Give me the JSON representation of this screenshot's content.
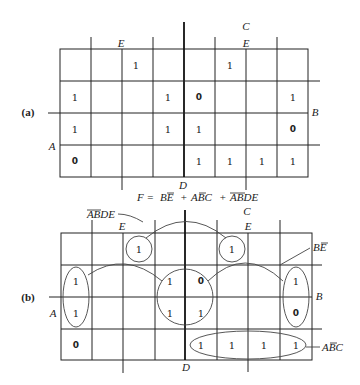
{
  "figure": {
    "panels": [
      {
        "id": "a",
        "label": "(a)",
        "variables": {
          "A": "A",
          "B": "B",
          "C": "C",
          "D": "D",
          "E_left": "E",
          "E_right": "E"
        },
        "cells": [
          [
            "",
            "",
            "1",
            "",
            "",
            "1",
            "",
            ""
          ],
          [
            "1",
            "",
            "",
            "1",
            "0",
            "",
            "",
            "1"
          ],
          [
            "1",
            "",
            "",
            "1",
            "1",
            "",
            "",
            "0"
          ],
          [
            "0",
            "",
            "",
            "",
            "1",
            "1",
            "1",
            "1"
          ]
        ]
      },
      {
        "id": "b",
        "label": "(b)",
        "variables": {
          "A": "A",
          "B": "B",
          "C": "C",
          "D": "D",
          "E_left": "E",
          "E_right": "E"
        },
        "cells": [
          [
            "",
            "",
            "1",
            "",
            "",
            "1",
            "",
            ""
          ],
          [
            "1",
            "",
            "",
            "1",
            "0",
            "",
            "",
            "1"
          ],
          [
            "1",
            "",
            "",
            "1",
            "1",
            "",
            "",
            "0"
          ],
          [
            "0",
            "",
            "",
            "",
            "1",
            "1",
            "1",
            "1"
          ]
        ],
        "groups": [
          {
            "term": "BĒ",
            "label_main": "BE",
            "overbar": "E"
          },
          {
            "term": "AB̄C",
            "label_main": "ABC",
            "overbar": "B"
          },
          {
            "term": "ĀB̄DE",
            "label_main": "ABDE",
            "overbar": "AB"
          }
        ]
      }
    ],
    "equation": {
      "lhs": "F =",
      "terms": [
        "BE",
        "ABC",
        "ABDE"
      ],
      "plus": "+",
      "full_text": "F = BĒ + AB̄C + ĀB̄DE"
    }
  }
}
